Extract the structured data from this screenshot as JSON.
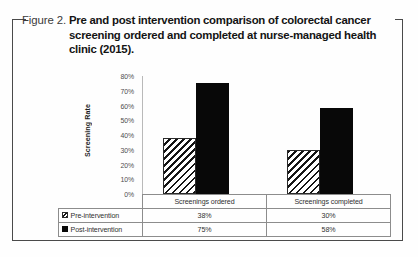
{
  "figure": {
    "label": "Figure 2.",
    "caption": "Pre and post intervention comparison of colorectal cancer screening ordered and completed at nurse-managed health clinic (2015)."
  },
  "chart_data": {
    "type": "bar",
    "title": "Pre and post intervention comparison of colorectal cancer screening ordered and completed at nurse-managed health clinic (2015).",
    "xlabel": "",
    "ylabel": "Screening Rate",
    "categories": [
      "Screenings ordered",
      "Screenings completed"
    ],
    "series": [
      {
        "name": "Pre-intervention",
        "values": [
          38,
          30
        ],
        "labels": [
          "38%",
          "30%"
        ],
        "pattern": "diagonal-hatch",
        "color": "#ffffff"
      },
      {
        "name": "Post-intervention",
        "values": [
          75,
          58
        ],
        "labels": [
          "75%",
          "58%"
        ],
        "pattern": "solid",
        "color": "#080808"
      }
    ],
    "ylim": [
      0,
      80
    ],
    "yticks": [
      0,
      10,
      20,
      30,
      40,
      50,
      60,
      70,
      80
    ],
    "ytick_labels": [
      "0%",
      "10%",
      "20%",
      "30%",
      "40%",
      "50%",
      "60%",
      "70%",
      "80%"
    ],
    "grid": false,
    "legend_position": "data-table"
  },
  "table": {
    "corner": "",
    "headers": [
      "Screenings ordered",
      "Screenings completed"
    ],
    "rows": [
      {
        "series": "Pre-intervention",
        "cells": [
          "38%",
          "30%"
        ]
      },
      {
        "series": "Post-intervention",
        "cells": [
          "75%",
          "58%"
        ]
      }
    ]
  }
}
